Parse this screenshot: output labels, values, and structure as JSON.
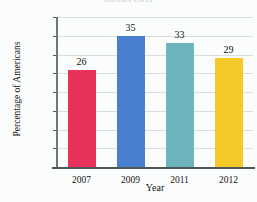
{
  "chart_data": {
    "type": "bar",
    "title": "Internet Users",
    "xlabel": "Year",
    "ylabel": "Percentage of Americans",
    "categories": [
      "2007",
      "2009",
      "2011",
      "2012"
    ],
    "values": [
      26,
      35,
      33,
      29
    ],
    "value_labels": [
      "26",
      "35",
      "33",
      "29"
    ],
    "bar_colors": [
      "#E8315B",
      "#4A7FD0",
      "#6DB4BC",
      "#F6C92A"
    ],
    "ylim": [
      0,
      40
    ],
    "ytick_labels": [
      "5%",
      "10%",
      "15%",
      "20%",
      "25%",
      "30%",
      "35%",
      "40%"
    ],
    "ytick_values": [
      5,
      10,
      15,
      20,
      25,
      30,
      35,
      40
    ],
    "grid": true,
    "legend": "none",
    "gridline_color": "#d9dde0",
    "axis_color": "#4e5756",
    "background": "#fbfcfc"
  }
}
